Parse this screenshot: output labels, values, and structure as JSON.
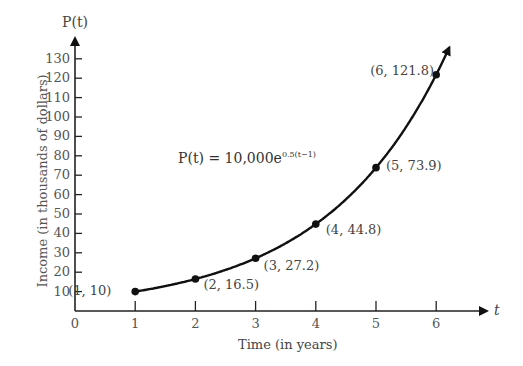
{
  "chart_data": {
    "type": "line",
    "title": "",
    "xlabel": "Time (in years)",
    "ylabel": "Income (in thousands of dollars)",
    "x_axis_name": "t",
    "y_axis_name": "P(t)",
    "formula": "P(t) = 10,000e^{0.5(t-1)}",
    "formula_lhs": "P(t) = 10,000e",
    "formula_exp": "0.5(t−1)",
    "xlim": [
      0,
      6.8
    ],
    "ylim": [
      0,
      135
    ],
    "x_ticks": [
      "0",
      "1",
      "2",
      "3",
      "4",
      "5",
      "6"
    ],
    "y_ticks": [
      "10",
      "20",
      "30",
      "40",
      "50",
      "60",
      "70",
      "80",
      "90",
      "100",
      "110",
      "120",
      "130"
    ],
    "grid": false,
    "points": [
      {
        "x": 1,
        "y": 10,
        "label": "(1, 10)"
      },
      {
        "x": 2,
        "y": 16.5,
        "label": "(2, 16.5)"
      },
      {
        "x": 3,
        "y": 27.2,
        "label": "(3, 27.2)"
      },
      {
        "x": 4,
        "y": 44.8,
        "label": "(4, 44.8)"
      },
      {
        "x": 5,
        "y": 73.9,
        "label": "(5, 73.9)"
      },
      {
        "x": 6,
        "y": 121.8,
        "label": "(6, 121.8)"
      }
    ]
  }
}
